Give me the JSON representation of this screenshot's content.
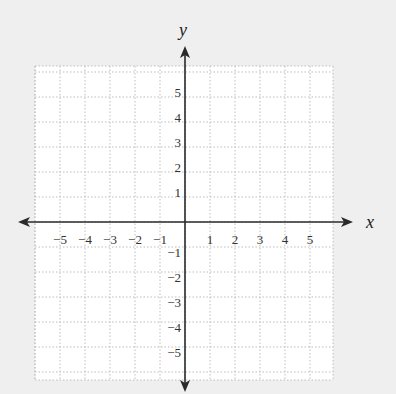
{
  "chart_data": {
    "type": "coordinate-plane",
    "title": "",
    "xlabel": "x",
    "ylabel": "y",
    "xlim": [
      -6,
      6
    ],
    "ylim": [
      -6,
      6
    ],
    "grid": true,
    "grid_style": "dotted",
    "x_ticks": [
      -5,
      -4,
      -3,
      -2,
      -1,
      1,
      2,
      3,
      4,
      5
    ],
    "y_ticks": [
      5,
      4,
      3,
      2,
      1,
      -1,
      -2,
      -3,
      -4,
      -5
    ],
    "x_tick_labels": [
      "−5",
      "−4",
      "−3",
      "−2",
      "−1",
      "1",
      "2",
      "3",
      "4",
      "5"
    ],
    "y_tick_labels": [
      "5",
      "4",
      "3",
      "2",
      "1",
      "−1",
      "−2",
      "−3",
      "−4",
      "−5"
    ],
    "points": []
  },
  "axes": {
    "x_label": "x",
    "y_label": "y"
  },
  "colors": {
    "background": "#efefef",
    "grid_fill": "#ffffff",
    "grid_line": "#bdbdbd",
    "axis": "#2a2a2a",
    "text": "#333333"
  }
}
